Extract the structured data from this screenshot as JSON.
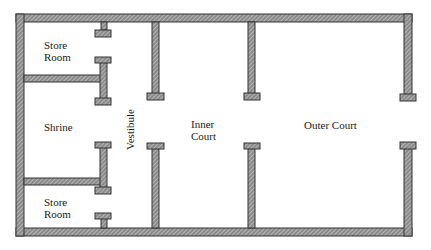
{
  "diagram": {
    "rooms": [
      {
        "id": "store-room-top",
        "label_line1": "Store",
        "label_line2": "Room"
      },
      {
        "id": "shrine",
        "label": "Shrine"
      },
      {
        "id": "store-room-bottom",
        "label_line1": "Store",
        "label_line2": "Room"
      },
      {
        "id": "vestibule",
        "label": "Vestibule"
      },
      {
        "id": "inner-court",
        "label_line1": "Inner",
        "label_line2": "Court"
      },
      {
        "id": "outer-court",
        "label": "Outer Court"
      }
    ],
    "colors": {
      "wall_fill": "#9a9a9a",
      "wall_edge": "#333333",
      "hatch": "#ffffff",
      "background": "#ffffff"
    }
  }
}
